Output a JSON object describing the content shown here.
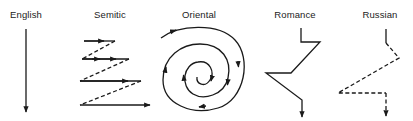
{
  "diagram": {
    "title": "",
    "panels": [
      {
        "id": "english",
        "label": "English",
        "pattern": "straight-down-arrow"
      },
      {
        "id": "semitic",
        "label": "Semitic",
        "pattern": "zigzag-solid-rightward-with-dashed-returns"
      },
      {
        "id": "oriental",
        "label": "Oriental",
        "pattern": "inward-spiral"
      },
      {
        "id": "romance",
        "label": "Romance",
        "pattern": "digressive-solid-zigzag-down"
      },
      {
        "id": "russian",
        "label": "Russian",
        "pattern": "digressive-dashed-zigzag-down"
      }
    ],
    "colors": {
      "stroke": "#1a1a1a",
      "text": "#222222",
      "background": "#ffffff"
    }
  }
}
